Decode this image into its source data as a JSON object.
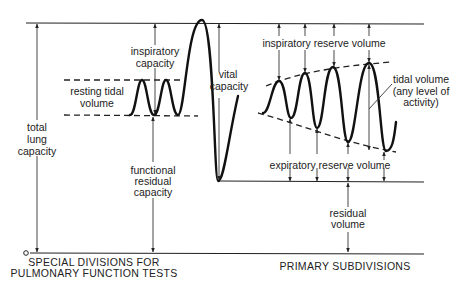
{
  "diagram": {
    "left_section": {
      "caption_line1": "SPECIAL DIVISIONS FOR",
      "caption_line2": "PULMONARY FUNCTION TESTS",
      "labels": {
        "total_lung_capacity_1": "total",
        "total_lung_capacity_2": "lung",
        "total_lung_capacity_3": "capacity",
        "inspiratory_capacity_1": "inspiratory",
        "inspiratory_capacity_2": "capacity",
        "resting_tidal_volume_1": "resting tidal",
        "resting_tidal_volume_2": "volume",
        "vital_capacity_1": "vital",
        "vital_capacity_2": "capacity",
        "functional_residual_capacity_1": "functional",
        "functional_residual_capacity_2": "residual",
        "functional_residual_capacity_3": "capacity"
      },
      "zero_marker": "o"
    },
    "right_section": {
      "caption": "PRIMARY SUBDIVISIONS",
      "labels": {
        "inspiratory_reserve_volume": "inspiratory reserve volume",
        "tidal_volume_1": "tidal volume",
        "tidal_volume_2": "(any level of",
        "tidal_volume_3": "activity)",
        "expiratory_reserve_volume": "expiratory reserve volume",
        "residual_volume_1": "residual",
        "residual_volume_2": "volume"
      }
    },
    "colors": {
      "ink": "#222222",
      "background": "#ffffff"
    }
  }
}
